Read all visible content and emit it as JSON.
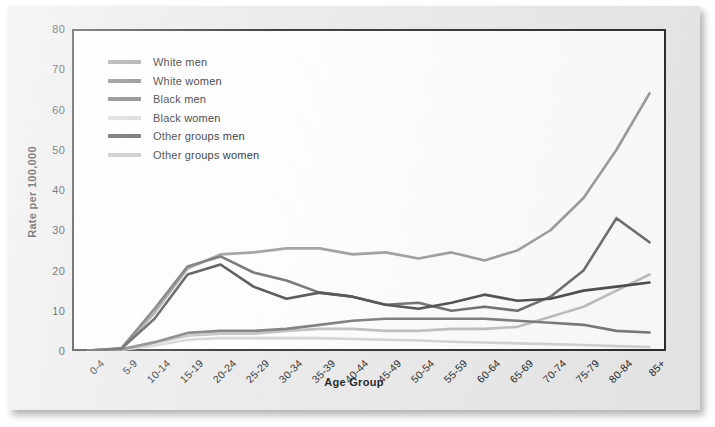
{
  "chart_data": {
    "type": "line",
    "title": "",
    "xlabel": "Age Group",
    "ylabel": "Rate per 100,000",
    "ylim": [
      0,
      80
    ],
    "yticks": [
      0,
      10,
      20,
      30,
      40,
      50,
      60,
      70,
      80
    ],
    "grid": false,
    "legend_position": "top-left-inside",
    "categories": [
      "0-4",
      "5-9",
      "10-14",
      "15-19",
      "20-24",
      "25-29",
      "30-34",
      "35-39",
      "40-44",
      "45-49",
      "50-54",
      "55-59",
      "60-64",
      "65-69",
      "70-74",
      "75-79",
      "80-84",
      "85+"
    ],
    "series": [
      {
        "name": "White men",
        "color": "#9a9a9a",
        "values": [
          0.1,
          0.6,
          9.5,
          20.5,
          24.0,
          24.5,
          25.5,
          25.5,
          24.0,
          24.5,
          23.0,
          24.5,
          22.5,
          25.0,
          30.0,
          38.0,
          50.0,
          64.0
        ]
      },
      {
        "name": "White women",
        "color": "#777777",
        "values": [
          0.1,
          0.4,
          2.2,
          4.5,
          5.0,
          5.0,
          5.5,
          6.5,
          7.5,
          8.0,
          8.0,
          8.0,
          8.0,
          7.5,
          7.0,
          6.5,
          5.0,
          4.6
        ]
      },
      {
        "name": "Black men",
        "color": "#6b6b6b",
        "values": [
          0.1,
          0.7,
          10.5,
          21.0,
          23.5,
          19.5,
          17.5,
          14.5,
          13.5,
          11.5,
          12.0,
          10.0,
          11.0,
          10.0,
          13.5,
          20.0,
          33.0,
          27.0
        ]
      },
      {
        "name": "Black women",
        "color": "#d2d2d2",
        "values": [
          0.1,
          0.3,
          1.3,
          2.8,
          3.2,
          3.2,
          3.2,
          3.2,
          3.0,
          2.8,
          2.6,
          2.3,
          2.1,
          1.9,
          1.7,
          1.5,
          1.2,
          1.0
        ]
      },
      {
        "name": "Other groups men",
        "color": "#4a4a4a",
        "values": [
          0.1,
          0.6,
          8.0,
          19.0,
          21.5,
          16.0,
          13.0,
          14.5,
          13.5,
          11.5,
          10.5,
          12.0,
          14.0,
          12.5,
          13.0,
          15.0,
          16.0,
          17.0
        ]
      },
      {
        "name": "Other groups women",
        "color": "#bdbdbd",
        "values": [
          0.1,
          0.3,
          2.0,
          3.8,
          4.3,
          4.3,
          5.0,
          5.5,
          5.5,
          5.0,
          5.0,
          5.5,
          5.5,
          6.0,
          8.5,
          11.0,
          15.0,
          19.0
        ]
      }
    ]
  }
}
